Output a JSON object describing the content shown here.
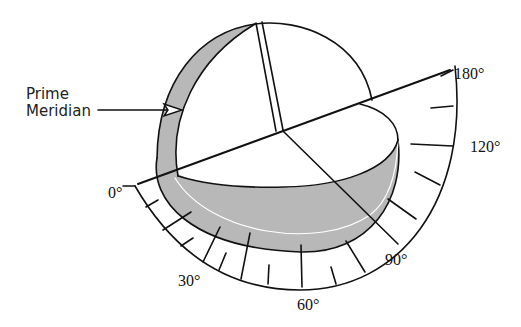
{
  "diagram": {
    "callout": {
      "line1": "Prime",
      "line2": "Meridian"
    },
    "scale_labels": {
      "deg0": "0°",
      "deg30": "30°",
      "deg60": "60°",
      "deg90": "90°",
      "deg120": "120°",
      "deg180": "180°"
    },
    "colors": {
      "shading": "#b8b8b8",
      "line": "#111111",
      "background": "#ffffff"
    }
  }
}
